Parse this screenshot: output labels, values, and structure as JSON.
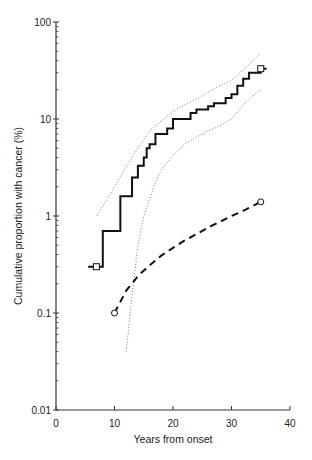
{
  "chart_data": {
    "type": "line",
    "title": "",
    "xlabel": "Years from onset",
    "ylabel": "Cumulative proportion with cancer (%)",
    "xlim": [
      0,
      40
    ],
    "ylim": [
      0.01,
      100
    ],
    "yscale": "log",
    "grid": false,
    "legend": null,
    "x_ticks": [
      "0",
      "10",
      "20",
      "30",
      "40"
    ],
    "y_ticks": [
      "0.01",
      "0.1",
      "1",
      "10",
      "100"
    ],
    "series": [
      {
        "name": "Observed cumulative incidence (step)",
        "style": "solid-step",
        "marker_ends": "square",
        "x": [
          5.5,
          7,
          8,
          10,
          11,
          12.5,
          13,
          14,
          15,
          15.5,
          16,
          17,
          18,
          19,
          20,
          22,
          23,
          24,
          25,
          26,
          27,
          28,
          29,
          30,
          31,
          32,
          33,
          34,
          35,
          36
        ],
        "values": [
          0.3,
          0.3,
          0.7,
          0.7,
          1.6,
          1.6,
          2.5,
          3.3,
          4.0,
          5.0,
          5.5,
          7.0,
          7.0,
          8.0,
          10.0,
          10.0,
          11.5,
          12.5,
          12.5,
          13.5,
          14.5,
          14.5,
          16.5,
          18,
          22,
          26,
          30,
          30,
          33,
          33
        ]
      },
      {
        "name": "Upper confidence limit",
        "style": "dotted",
        "x": [
          7,
          10,
          12,
          14,
          16,
          18,
          20,
          22,
          24,
          26,
          28,
          30,
          32,
          34,
          35
        ],
        "values": [
          1.0,
          2.0,
          3.2,
          5.0,
          7.5,
          9.5,
          12,
          14,
          16,
          19,
          22,
          25,
          32,
          42,
          48
        ]
      },
      {
        "name": "Lower confidence limit",
        "style": "dotted",
        "x": [
          12,
          13,
          14,
          15,
          16,
          17,
          18,
          20,
          22,
          24,
          26,
          28,
          30,
          32,
          34,
          35
        ],
        "values": [
          0.04,
          0.15,
          0.5,
          1.0,
          1.5,
          2.2,
          3.0,
          4.2,
          5.5,
          6.5,
          7.5,
          8.5,
          10,
          14,
          18,
          20
        ]
      },
      {
        "name": "Expected (general population)",
        "style": "dashed",
        "marker_ends": "circle",
        "x": [
          10,
          12,
          14,
          16,
          18,
          20,
          22,
          24,
          26,
          28,
          30,
          32,
          34,
          35
        ],
        "values": [
          0.1,
          0.17,
          0.24,
          0.31,
          0.39,
          0.47,
          0.56,
          0.65,
          0.76,
          0.87,
          1.0,
          1.13,
          1.3,
          1.4
        ]
      }
    ]
  }
}
